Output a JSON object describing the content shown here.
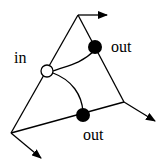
{
  "diagram": {
    "labels": {
      "in": "in",
      "out_top": "out",
      "out_bottom": "out"
    },
    "vertices": {
      "top": [
        78,
        15
      ],
      "right": [
        124,
        102
      ],
      "bottom_left": [
        11,
        133
      ]
    },
    "nodes": [
      {
        "id": "in-node",
        "type": "input",
        "fill": "#ffffff",
        "cx": 47,
        "cy": 71,
        "r": 6
      },
      {
        "id": "out-node-top",
        "type": "output",
        "fill": "#000000",
        "cx": 95,
        "cy": 47,
        "r": 7
      },
      {
        "id": "out-node-bottom",
        "type": "output",
        "fill": "#000000",
        "cx": 83,
        "cy": 115,
        "r": 7
      }
    ],
    "colors": {
      "stroke": "#000000",
      "background": "#ffffff"
    }
  }
}
